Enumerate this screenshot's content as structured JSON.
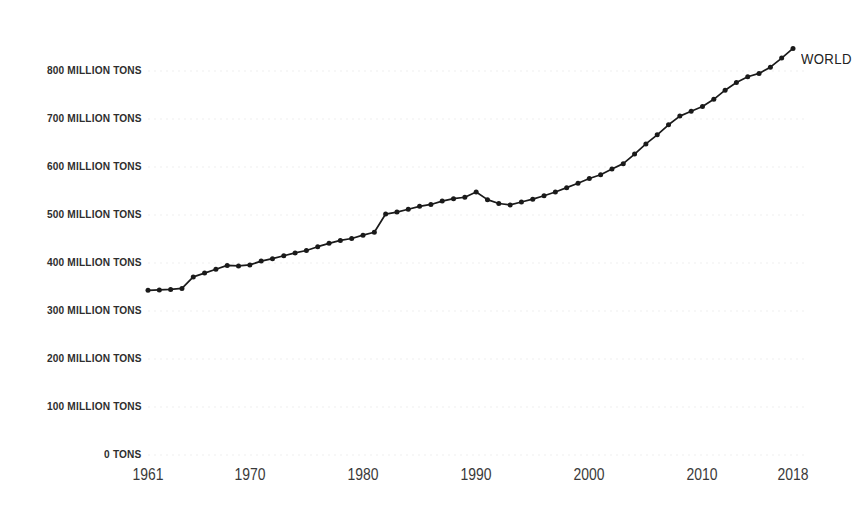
{
  "chart_data": {
    "type": "line",
    "title": "",
    "subtitle": "",
    "xlabel": "",
    "ylabel": "",
    "xlim": [
      1961,
      2018
    ],
    "ylim": [
      0,
      850
    ],
    "grid": true,
    "grid_axis": "y",
    "legend_position": "inline-end-of-line",
    "series_label": "WORLD",
    "line_color": "#1a1a1a",
    "marker_color": "#1a1a1a",
    "gridline_color": "#efefef",
    "background_color": "#ffffff",
    "y_ticks": [
      {
        "value": 0,
        "label": "0 TONS"
      },
      {
        "value": 100,
        "label": "100 MILLION TONS"
      },
      {
        "value": 200,
        "label": "200 MILLION TONS"
      },
      {
        "value": 300,
        "label": "300 MILLION TONS"
      },
      {
        "value": 400,
        "label": "400 MILLION TONS"
      },
      {
        "value": 500,
        "label": "500 MILLION TONS"
      },
      {
        "value": 600,
        "label": "600 MILLION TONS"
      },
      {
        "value": 700,
        "label": "700 MILLION TONS"
      },
      {
        "value": 800,
        "label": "800 MILLION TONS"
      }
    ],
    "x_ticks": [
      {
        "value": 1961,
        "label": "1961"
      },
      {
        "value": 1970,
        "label": "1970"
      },
      {
        "value": 1980,
        "label": "1980"
      },
      {
        "value": 1990,
        "label": "1990"
      },
      {
        "value": 2000,
        "label": "2000"
      },
      {
        "value": 2010,
        "label": "2010"
      },
      {
        "value": 2018,
        "label": "2018"
      }
    ],
    "x": [
      1961,
      1962,
      1963,
      1964,
      1965,
      1966,
      1967,
      1968,
      1969,
      1970,
      1971,
      1972,
      1973,
      1974,
      1975,
      1976,
      1977,
      1978,
      1979,
      1980,
      1981,
      1982,
      1983,
      1984,
      1985,
      1986,
      1987,
      1988,
      1989,
      1990,
      1991,
      1992,
      1993,
      1994,
      1995,
      1996,
      1997,
      1998,
      1999,
      2000,
      2001,
      2002,
      2003,
      2004,
      2005,
      2006,
      2007,
      2008,
      2009,
      2010,
      2011,
      2012,
      2013,
      2014,
      2015,
      2016,
      2017,
      2018
    ],
    "series": [
      {
        "name": "WORLD",
        "unit": "million tons",
        "values": [
          343,
          344,
          345,
          347,
          371,
          379,
          387,
          395,
          394,
          396,
          404,
          409,
          415,
          421,
          426,
          434,
          441,
          447,
          451,
          458,
          464,
          502,
          506,
          512,
          518,
          522,
          529,
          534,
          537,
          548,
          532,
          524,
          521,
          527,
          533,
          540,
          548,
          557,
          566,
          576,
          584,
          596,
          607,
          627,
          648,
          667,
          688,
          706,
          716,
          726,
          741,
          760,
          776,
          788,
          795,
          808,
          827,
          847
        ]
      }
    ]
  }
}
